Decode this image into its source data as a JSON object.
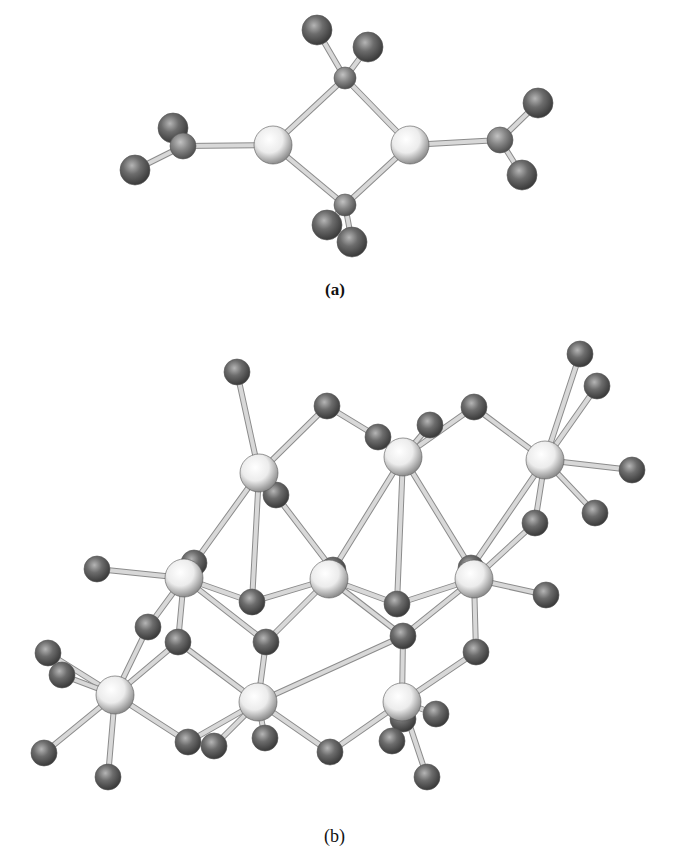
{
  "figure": {
    "panels": [
      {
        "id": "a",
        "caption": "(a)"
      },
      {
        "id": "b",
        "caption": "(b)"
      }
    ]
  },
  "colors": {
    "background": "#ffffff",
    "metal_atom": "#f2f2f2",
    "metal_atom_shade": "#9a9a9a",
    "ligand_atom": "#6a6a6a",
    "ligand_atom_dark": "#3a3a3a",
    "bond": "#d8d8d8",
    "bond_edge": "#8c8c8c",
    "caption_text": "#111111"
  },
  "structure_a": {
    "metal_atoms": [
      [
        273,
        145
      ],
      [
        410,
        145
      ]
    ],
    "bridge_atoms": [
      [
        345,
        78
      ],
      [
        345,
        205
      ]
    ],
    "center_atoms": [
      [
        183,
        146
      ],
      [
        500,
        140
      ]
    ],
    "terminal_atoms": [
      [
        317,
        30
      ],
      [
        368,
        47
      ],
      [
        327,
        225
      ],
      [
        352,
        242
      ],
      [
        173,
        128
      ],
      [
        135,
        170
      ],
      [
        538,
        103
      ],
      [
        522,
        175
      ]
    ],
    "bonds": [
      [
        [
          273,
          145
        ],
        [
          345,
          78
        ]
      ],
      [
        [
          345,
          78
        ],
        [
          410,
          145
        ]
      ],
      [
        [
          410,
          145
        ],
        [
          345,
          205
        ]
      ],
      [
        [
          345,
          205
        ],
        [
          273,
          145
        ]
      ],
      [
        [
          345,
          78
        ],
        [
          317,
          30
        ]
      ],
      [
        [
          345,
          78
        ],
        [
          368,
          47
        ]
      ],
      [
        [
          345,
          205
        ],
        [
          327,
          225
        ]
      ],
      [
        [
          345,
          205
        ],
        [
          352,
          242
        ]
      ],
      [
        [
          273,
          145
        ],
        [
          183,
          146
        ]
      ],
      [
        [
          183,
          146
        ],
        [
          173,
          128
        ]
      ],
      [
        [
          183,
          146
        ],
        [
          135,
          170
        ]
      ],
      [
        [
          410,
          145
        ],
        [
          500,
          140
        ]
      ],
      [
        [
          500,
          140
        ],
        [
          538,
          103
        ]
      ],
      [
        [
          500,
          140
        ],
        [
          522,
          175
        ]
      ]
    ]
  },
  "structure_b": {
    "metal_atoms": [
      [
        259,
        473
      ],
      [
        403,
        457
      ],
      [
        545,
        460
      ],
      [
        184,
        578
      ],
      [
        329,
        579
      ],
      [
        474,
        579
      ],
      [
        115,
        695
      ],
      [
        258,
        702
      ],
      [
        402,
        702
      ]
    ],
    "ligand_atoms": [
      [
        237,
        372
      ],
      [
        327,
        406
      ],
      [
        474,
        407
      ],
      [
        580,
        354
      ],
      [
        597,
        386
      ],
      [
        632,
        470
      ],
      [
        595,
        513
      ],
      [
        378,
        437
      ],
      [
        430,
        425
      ],
      [
        276,
        495
      ],
      [
        194,
        563
      ],
      [
        333,
        570
      ],
      [
        471,
        568
      ],
      [
        535,
        523
      ],
      [
        252,
        602
      ],
      [
        397,
        604
      ],
      [
        546,
        595
      ],
      [
        97,
        569
      ],
      [
        148,
        627
      ],
      [
        178,
        642
      ],
      [
        266,
        642
      ],
      [
        403,
        636
      ],
      [
        476,
        652
      ],
      [
        48,
        653
      ],
      [
        62,
        675
      ],
      [
        265,
        738
      ],
      [
        403,
        719
      ],
      [
        436,
        714
      ],
      [
        44,
        753
      ],
      [
        108,
        777
      ],
      [
        188,
        742
      ],
      [
        214,
        746
      ],
      [
        330,
        752
      ],
      [
        392,
        741
      ],
      [
        427,
        777
      ]
    ],
    "bonds": [
      [
        [
          259,
          473
        ],
        [
          237,
          372
        ]
      ],
      [
        [
          259,
          473
        ],
        [
          327,
          406
        ]
      ],
      [
        [
          327,
          406
        ],
        [
          378,
          437
        ]
      ],
      [
        [
          259,
          473
        ],
        [
          333,
          570
        ]
      ],
      [
        [
          259,
          473
        ],
        [
          194,
          563
        ]
      ],
      [
        [
          259,
          473
        ],
        [
          252,
          602
        ]
      ],
      [
        [
          403,
          457
        ],
        [
          378,
          437
        ]
      ],
      [
        [
          403,
          457
        ],
        [
          474,
          407
        ]
      ],
      [
        [
          403,
          457
        ],
        [
          333,
          570
        ]
      ],
      [
        [
          403,
          457
        ],
        [
          397,
          604
        ]
      ],
      [
        [
          403,
          457
        ],
        [
          471,
          568
        ]
      ],
      [
        [
          403,
          457
        ],
        [
          430,
          425
        ]
      ],
      [
        [
          474,
          407
        ],
        [
          545,
          460
        ]
      ],
      [
        [
          545,
          460
        ],
        [
          580,
          354
        ]
      ],
      [
        [
          545,
          460
        ],
        [
          597,
          386
        ]
      ],
      [
        [
          545,
          460
        ],
        [
          632,
          470
        ]
      ],
      [
        [
          545,
          460
        ],
        [
          595,
          513
        ]
      ],
      [
        [
          545,
          460
        ],
        [
          471,
          568
        ]
      ],
      [
        [
          545,
          460
        ],
        [
          535,
          523
        ]
      ],
      [
        [
          184,
          578
        ],
        [
          97,
          569
        ]
      ],
      [
        [
          184,
          578
        ],
        [
          194,
          563
        ]
      ],
      [
        [
          184,
          578
        ],
        [
          252,
          602
        ]
      ],
      [
        [
          184,
          578
        ],
        [
          148,
          627
        ]
      ],
      [
        [
          184,
          578
        ],
        [
          266,
          642
        ]
      ],
      [
        [
          184,
          578
        ],
        [
          178,
          642
        ]
      ],
      [
        [
          329,
          579
        ],
        [
          252,
          602
        ]
      ],
      [
        [
          329,
          579
        ],
        [
          397,
          604
        ]
      ],
      [
        [
          329,
          579
        ],
        [
          333,
          570
        ]
      ],
      [
        [
          329,
          579
        ],
        [
          403,
          636
        ]
      ],
      [
        [
          329,
          579
        ],
        [
          266,
          642
        ]
      ],
      [
        [
          474,
          579
        ],
        [
          397,
          604
        ]
      ],
      [
        [
          474,
          579
        ],
        [
          471,
          568
        ]
      ],
      [
        [
          474,
          579
        ],
        [
          535,
          523
        ]
      ],
      [
        [
          474,
          579
        ],
        [
          546,
          595
        ]
      ],
      [
        [
          474,
          579
        ],
        [
          403,
          636
        ]
      ],
      [
        [
          474,
          579
        ],
        [
          476,
          652
        ]
      ],
      [
        [
          115,
          695
        ],
        [
          148,
          627
        ]
      ],
      [
        [
          115,
          695
        ],
        [
          178,
          642
        ]
      ],
      [
        [
          115,
          695
        ],
        [
          48,
          653
        ]
      ],
      [
        [
          115,
          695
        ],
        [
          62,
          675
        ]
      ],
      [
        [
          115,
          695
        ],
        [
          44,
          753
        ]
      ],
      [
        [
          115,
          695
        ],
        [
          108,
          777
        ]
      ],
      [
        [
          115,
          695
        ],
        [
          188,
          742
        ]
      ],
      [
        [
          258,
          702
        ],
        [
          178,
          642
        ]
      ],
      [
        [
          258,
          702
        ],
        [
          266,
          642
        ]
      ],
      [
        [
          258,
          702
        ],
        [
          403,
          636
        ]
      ],
      [
        [
          258,
          702
        ],
        [
          265,
          738
        ]
      ],
      [
        [
          258,
          702
        ],
        [
          188,
          742
        ]
      ],
      [
        [
          258,
          702
        ],
        [
          214,
          746
        ]
      ],
      [
        [
          258,
          702
        ],
        [
          330,
          752
        ]
      ],
      [
        [
          402,
          702
        ],
        [
          403,
          636
        ]
      ],
      [
        [
          402,
          702
        ],
        [
          476,
          652
        ]
      ],
      [
        [
          402,
          702
        ],
        [
          403,
          719
        ]
      ],
      [
        [
          402,
          702
        ],
        [
          436,
          714
        ]
      ],
      [
        [
          402,
          702
        ],
        [
          330,
          752
        ]
      ],
      [
        [
          402,
          702
        ],
        [
          392,
          741
        ]
      ],
      [
        [
          402,
          702
        ],
        [
          427,
          777
        ]
      ]
    ]
  }
}
